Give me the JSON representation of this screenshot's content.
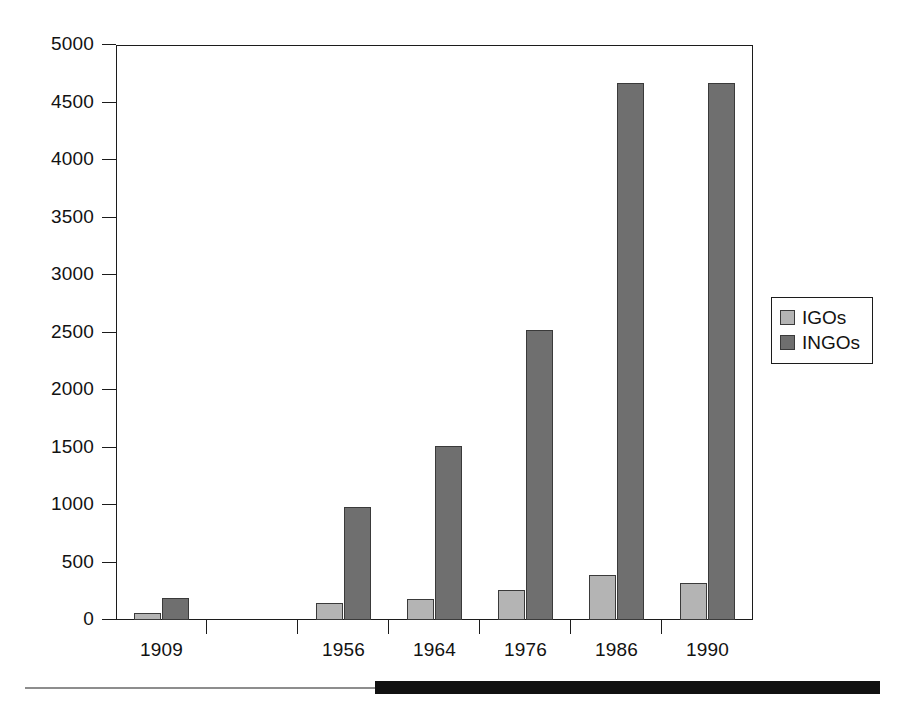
{
  "chart_data": {
    "type": "bar",
    "title": "",
    "xlabel": "",
    "ylabel": "",
    "categories": [
      "1909",
      "",
      "1956",
      "1964",
      "1976",
      "1986",
      "1990"
    ],
    "ylim": [
      0,
      5000
    ],
    "yticks": [
      0,
      500,
      1000,
      1500,
      2000,
      2500,
      3000,
      3500,
      4000,
      4500,
      5000
    ],
    "ytick_labels": [
      "0",
      "500",
      "1000",
      "1500",
      "2000",
      "2500",
      "3000",
      "3500",
      "4000",
      "4500",
      "5000"
    ],
    "grid": false,
    "legend_position": "right",
    "series": [
      {
        "name": "IGOs",
        "color": "#b4b4b4",
        "values": [
          60,
          null,
          145,
          180,
          260,
          390,
          325
        ]
      },
      {
        "name": "INGOs",
        "color": "#6f6f6f",
        "values": [
          195,
          null,
          980,
          1515,
          2520,
          4670,
          4670
        ]
      }
    ]
  },
  "legend": {
    "items": [
      {
        "label": "IGOs",
        "swatch": "igo"
      },
      {
        "label": "INGOs",
        "swatch": "ingo"
      }
    ]
  },
  "colors": {
    "igo": "#b4b4b4",
    "ingo": "#6f6f6f",
    "axis": "#1c1c1c",
    "bar_edge": "#3a3a3a",
    "rule_thin": "#8d8d8d",
    "rule_thick": "#111111",
    "background": "#ffffff"
  }
}
